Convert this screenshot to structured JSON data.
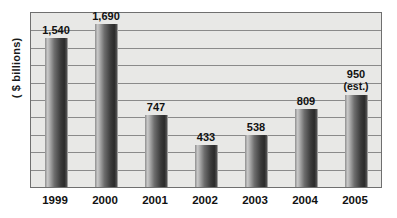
{
  "title_sliver": "",
  "axis": {
    "y_label": "( $ billions)"
  },
  "chart_data": {
    "type": "bar",
    "title": "",
    "xlabel": "",
    "ylabel": "( $ billions)",
    "categories": [
      "1999",
      "2000",
      "2001",
      "2002",
      "2003",
      "2004",
      "2005"
    ],
    "values": [
      1540,
      1690,
      747,
      433,
      538,
      809,
      950
    ],
    "value_labels": [
      "1,540",
      "1,690",
      "747",
      "433",
      "538",
      "809",
      "950"
    ],
    "annotations": [
      "",
      "",
      "",
      "",
      "",
      "",
      "(est.)"
    ],
    "ylim": [
      0,
      1800
    ],
    "grid": true,
    "gridlines": 9,
    "legend": "none",
    "colors": {
      "bar_light": "#c9c9c9",
      "bar_dark": "#2b2b2b",
      "plot_background": "#e8e8e6",
      "gridline": "#8a8a8a",
      "frame": "#6f6f6f",
      "text": "#111111",
      "page_background": "#ffffff"
    }
  }
}
